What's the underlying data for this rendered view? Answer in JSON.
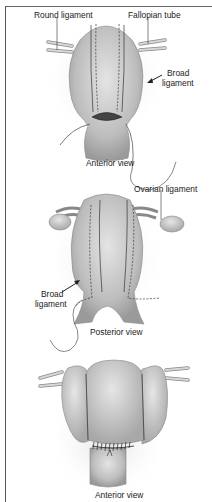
{
  "figure": {
    "panels": [
      {
        "id": "anterior-top",
        "caption": "Anterior view",
        "labels": {
          "round_ligament": "Round ligament",
          "fallopian_tube": "Fallopian tube",
          "broad_ligament_line1": "Broad",
          "broad_ligament_line2": "ligament"
        }
      },
      {
        "id": "posterior",
        "caption": "Posterior view",
        "labels": {
          "ovarian_ligament": "Ovarian ligament",
          "broad_ligament_line1": "Broad",
          "broad_ligament_line2": "ligament"
        }
      },
      {
        "id": "anterior-bottom",
        "caption": "Anterior view",
        "labels": {}
      }
    ],
    "colors": {
      "tissue": "#c8c8c8",
      "tissue_dark": "#8a8a8a",
      "line": "#333333",
      "border": "#555555"
    }
  }
}
